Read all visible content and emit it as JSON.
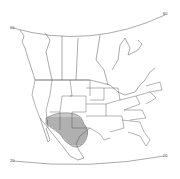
{
  "map": {
    "type": "range-map",
    "region": "North America",
    "projection_labels": {
      "top_left": "60",
      "top_right": "60",
      "bottom_left": "20",
      "bottom_right": "20"
    },
    "shaded_area": {
      "description": "hatched distribution range",
      "regions": [
        "Arizona",
        "New Mexico",
        "Texas",
        "Sonora",
        "Chihuahua",
        "Coahuila",
        "Durango"
      ]
    },
    "colors": {
      "boundary": "#555555",
      "hatch": "#444444",
      "background": "#ffffff"
    }
  }
}
